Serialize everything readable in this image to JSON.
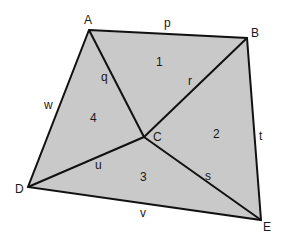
{
  "diagram": {
    "fill_color": "#c9c9c9",
    "stroke_color": "#111111",
    "vertices": {
      "A": {
        "label": "A",
        "x": 89,
        "y": 30
      },
      "B": {
        "label": "B",
        "x": 247,
        "y": 38
      },
      "C": {
        "label": "C",
        "x": 144,
        "y": 137
      },
      "D": {
        "label": "D",
        "x": 28,
        "y": 187
      },
      "E": {
        "label": "E",
        "x": 261,
        "y": 220
      }
    },
    "edges": [
      {
        "label": "p",
        "from": "A",
        "to": "B"
      },
      {
        "label": "t",
        "from": "B",
        "to": "E"
      },
      {
        "label": "v",
        "from": "D",
        "to": "E"
      },
      {
        "label": "w",
        "from": "A",
        "to": "D"
      },
      {
        "label": "q",
        "from": "A",
        "to": "C"
      },
      {
        "label": "r",
        "from": "B",
        "to": "C"
      },
      {
        "label": "s",
        "from": "E",
        "to": "C"
      },
      {
        "label": "u",
        "from": "D",
        "to": "C"
      }
    ],
    "regions": [
      {
        "label": "1"
      },
      {
        "label": "2"
      },
      {
        "label": "3"
      },
      {
        "label": "4"
      }
    ]
  }
}
